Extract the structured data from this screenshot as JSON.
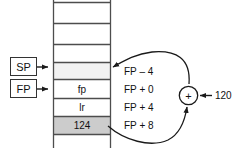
{
  "diagram": {
    "registers": [
      {
        "name": "sp-register-box",
        "label": "SP"
      },
      {
        "name": "fp-register-box",
        "label": "FP"
      }
    ],
    "stack_cells": [
      {
        "id": "cell-empty-1",
        "value": "",
        "fill": "#ffffff"
      },
      {
        "id": "cell-empty-2",
        "value": "",
        "fill": "#ffffff"
      },
      {
        "id": "cell-empty-3",
        "value": "",
        "fill": "#ffffff"
      },
      {
        "id": "cell-sp-top",
        "value": "",
        "fill": "#f2f2f2"
      },
      {
        "id": "cell-fp",
        "value": "fp",
        "fill": "#ffffff"
      },
      {
        "id": "cell-lr",
        "value": "lr",
        "fill": "#ffffff"
      },
      {
        "id": "cell-124",
        "value": "124",
        "fill": "#cccccc"
      }
    ],
    "address_labels": [
      {
        "id": "addr-fp-minus-4",
        "text": "FP – 4"
      },
      {
        "id": "addr-fp-plus-0",
        "text": "FP + 0"
      },
      {
        "id": "addr-fp-plus-4",
        "text": "FP + 4"
      },
      {
        "id": "addr-fp-plus-8",
        "text": "FP + 8"
      }
    ],
    "adder": {
      "symbol": "+",
      "operand_label": "120"
    },
    "colors": {
      "stroke": "#333333",
      "text": "#111111",
      "cell_highlight": "#f2f2f2",
      "cell_shaded": "#cccccc",
      "background": "#ffffff"
    }
  }
}
